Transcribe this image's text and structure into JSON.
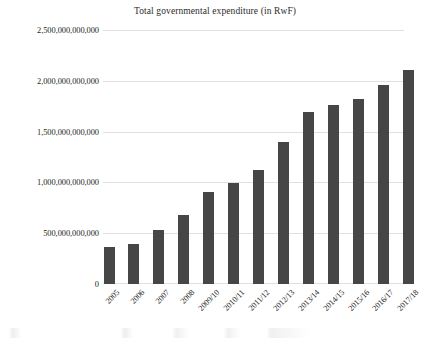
{
  "chart_data": {
    "type": "bar",
    "title": "Total governmental expenditure (in RwF)",
    "xlabel": "",
    "ylabel": "",
    "categories": [
      "2005",
      "2006",
      "2007",
      "2008",
      "2009/10",
      "2010/11",
      "2011/12",
      "2012/13",
      "2013/14",
      "2014/15",
      "2015/16",
      "2016/17",
      "2017/18"
    ],
    "values": [
      370000000000,
      395000000000,
      530000000000,
      680000000000,
      910000000000,
      1000000000000,
      1130000000000,
      1400000000000,
      1700000000000,
      1765000000000,
      1825000000000,
      1970000000000,
      2110000000000
    ],
    "ylim": [
      0,
      2500000000000
    ],
    "ytick_labels": [
      "0",
      "500,000,000,000",
      "1,000,000,000,000",
      "1,500,000,000,000",
      "2,000,000,000,000",
      "2,500,000,000,000"
    ],
    "ytick_values": [
      0,
      500000000000,
      1000000000000,
      1500000000000,
      2000000000000,
      2500000000000
    ],
    "grid": true,
    "legend": false,
    "bar_color": "#464646",
    "grid_color": "#e2e0de",
    "background_color": "#ffffff"
  }
}
